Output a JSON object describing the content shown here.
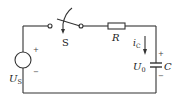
{
  "diagram": {
    "type": "RC circuit schematic",
    "colors": {
      "line": "#333333",
      "text": "#222222",
      "background": "#ffffff"
    },
    "source": {
      "symbol": "voltage-source-circle",
      "label_main": "U",
      "label_sub": "S",
      "plus": "+",
      "minus": "−"
    },
    "switch": {
      "symbol": "switch-with-arrow",
      "label": "S"
    },
    "resistor": {
      "symbol": "resistor-box",
      "label": "R"
    },
    "current": {
      "symbol": "down-arrow",
      "label_main": "i",
      "label_sub": "C"
    },
    "capacitor": {
      "symbol": "capacitor-plates",
      "label": "C",
      "voltage_main": "U",
      "voltage_sub": "0",
      "plus": "+",
      "minus": "−"
    }
  }
}
